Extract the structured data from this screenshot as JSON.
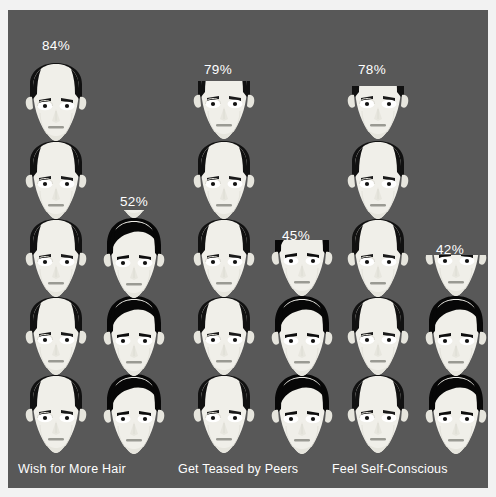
{
  "chart_data": {
    "type": "pictogram",
    "title": "",
    "subtitle": "",
    "xlabel": "",
    "ylabel": "",
    "unit_note": "Each face icon represents 1/6 of the sample (approx. 16.7%)",
    "icon_semantics": {
      "balding": "balding-man-face-icon",
      "haired": "full-hair-man-face-icon"
    },
    "legend": [
      {
        "name": "Balding men",
        "icon": "balding-man-face-icon",
        "hair_color": "#1a1a1a",
        "skin_color": "#f0efe9"
      },
      {
        "name": "Men with full hair",
        "icon": "full-hair-man-face-icon",
        "hair_color": "#0b0b0b",
        "skin_color": "#f0efe9"
      }
    ],
    "categories": [
      "Wish for More Hair",
      "Get Teased by Peers",
      "Feel Self-Conscious"
    ],
    "series": [
      {
        "name": "Balding men",
        "values": [
          84,
          79,
          78
        ],
        "value_labels": [
          "84%",
          "79%",
          "78%"
        ]
      },
      {
        "name": "Men with full hair",
        "values": [
          52,
          45,
          42
        ],
        "value_labels": [
          "52%",
          "45%",
          "42%"
        ]
      }
    ],
    "groups": [
      {
        "label": "Wish for More Hair",
        "bars": [
          {
            "series": "Balding men",
            "value": 84,
            "label": "84%",
            "full_icons": 5,
            "partial_fraction": 0.04,
            "icon": "balding-man-face-icon"
          },
          {
            "series": "Men with full hair",
            "value": 52,
            "label": "52%",
            "full_icons": 3,
            "partial_fraction": 0.12,
            "icon": "full-hair-man-face-icon"
          }
        ]
      },
      {
        "label": "Get Teased by Peers",
        "bars": [
          {
            "series": "Balding men",
            "value": 79,
            "label": "79%",
            "full_icons": 4,
            "partial_fraction": 0.74,
            "icon": "balding-man-face-icon"
          },
          {
            "series": "Men with full hair",
            "value": 45,
            "label": "45%",
            "full_icons": 2,
            "partial_fraction": 0.7,
            "icon": "full-hair-man-face-icon"
          }
        ]
      },
      {
        "label": "Feel Self-Conscious",
        "bars": [
          {
            "series": "Balding men",
            "value": 78,
            "label": "78%",
            "full_icons": 4,
            "partial_fraction": 0.68,
            "icon": "balding-man-face-icon"
          },
          {
            "series": "Men with full hair",
            "value": 42,
            "label": "42%",
            "full_icons": 2,
            "partial_fraction": 0.52,
            "icon": "full-hair-man-face-icon"
          }
        ]
      }
    ],
    "colors": {
      "background": "#585858",
      "page": "#f2f2f2",
      "text": "#ffffff",
      "skin": "#f0efe9",
      "skin_shadow": "#d9d8d0",
      "hair_dark": "#111111",
      "hair_black": "#070707",
      "feature": "#9a9a93"
    },
    "grid": false,
    "legend_position": "none"
  },
  "labels": {
    "group1": "Wish for More Hair",
    "group2": "Get Teased by Peers",
    "group3": "Feel Self-Conscious"
  },
  "percents": {
    "g1_bald": "84%",
    "g1_hair": "52%",
    "g2_bald": "79%",
    "g2_hair": "45%",
    "g3_bald": "78%",
    "g3_hair": "42%"
  }
}
